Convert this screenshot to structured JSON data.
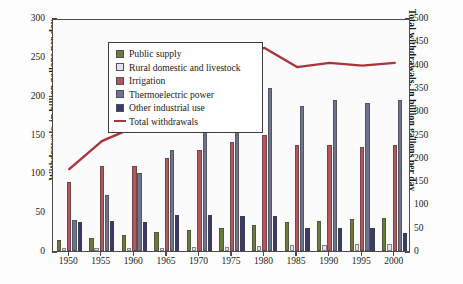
{
  "figure": {
    "background": "#fdfdfd",
    "plot_border_color": "#4c4c4c"
  },
  "axes": {
    "left": {
      "title": "Withdrawals, in billion gallons per day",
      "ticks": [
        0,
        50,
        100,
        150,
        200,
        250,
        300
      ],
      "min": 0,
      "max": 300
    },
    "right": {
      "title": "Total withdrawals, in billion gallons per day",
      "ticks": [
        0,
        50,
        100,
        150,
        200,
        250,
        300,
        350,
        400,
        450,
        500
      ],
      "min": 0,
      "max": 500
    },
    "x": {
      "ticks": [
        "1950",
        "1955",
        "1960",
        "1965",
        "1970",
        "1975",
        "1980",
        "1985",
        "1990",
        "1995",
        "2000"
      ]
    }
  },
  "legend": {
    "items": [
      {
        "label": "Public supply",
        "color": "#6b7b3a",
        "type": "swatch"
      },
      {
        "label": "Rural domestic and livestock",
        "color": "#e3e3e8",
        "type": "swatch"
      },
      {
        "label": "Irrigation",
        "color": "#b5555c",
        "type": "swatch"
      },
      {
        "label": "Thermoelectric power",
        "color": "#6e7490",
        "type": "swatch"
      },
      {
        "label": "Other industrial use",
        "color": "#3b3a6b",
        "type": "swatch"
      },
      {
        "label": "Total withdrawals",
        "color": "#a8353c",
        "type": "line"
      }
    ]
  },
  "chart_data": {
    "type": "bar",
    "title": "",
    "xlabel": "",
    "ylabel": "Withdrawals, in billion gallons per day",
    "y2label": "Total withdrawals, in billion gallons per day",
    "ylim": [
      0,
      300
    ],
    "y2lim": [
      0,
      500
    ],
    "grid": false,
    "legend_position": "upper-left-inside",
    "categories": [
      "1950",
      "1955",
      "1960",
      "1965",
      "1970",
      "1975",
      "1980",
      "1985",
      "1990",
      "1995",
      "2000"
    ],
    "series": [
      {
        "name": "Public supply",
        "axis": "left",
        "color": "#6b7b3a",
        "kind": "bar",
        "values": [
          14,
          17,
          21,
          24,
          27,
          29,
          34,
          37,
          39,
          41,
          43
        ]
      },
      {
        "name": "Rural domestic and livestock",
        "axis": "left",
        "color": "#e3e3e8",
        "kind": "bar",
        "values": [
          4,
          4,
          4,
          4,
          5,
          5,
          6,
          8,
          8,
          9,
          9
        ]
      },
      {
        "name": "Irrigation",
        "axis": "left",
        "color": "#b5555c",
        "kind": "bar",
        "values": [
          89,
          110,
          110,
          120,
          130,
          140,
          150,
          137,
          137,
          134,
          137
        ]
      },
      {
        "name": "Thermoelectric power",
        "axis": "left",
        "color": "#6e7490",
        "kind": "bar",
        "values": [
          40,
          72,
          100,
          130,
          170,
          200,
          210,
          187,
          195,
          190,
          195
        ]
      },
      {
        "name": "Other industrial use",
        "axis": "left",
        "color": "#3b3a6b",
        "kind": "bar",
        "values": [
          37,
          39,
          38,
          46,
          47,
          45,
          45,
          30,
          30,
          29,
          23
        ]
      },
      {
        "name": "Total withdrawals",
        "axis": "right",
        "color": "#a8353c",
        "kind": "line",
        "values": [
          180,
          240,
          270,
          310,
          370,
          420,
          440,
          399,
          408,
          402,
          408
        ]
      }
    ]
  }
}
